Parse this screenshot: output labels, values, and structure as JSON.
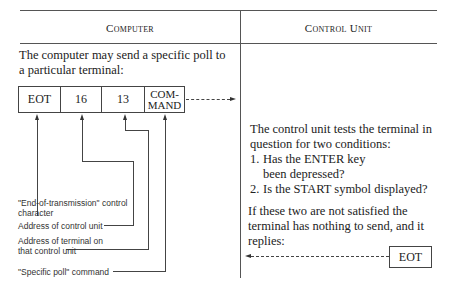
{
  "columns": {
    "computer": {
      "header": "Computer",
      "intro": "The computer may send a specific poll to a particular terminal:",
      "message_fields": [
        "EOT",
        "16",
        "13",
        "COM-\nMAND"
      ],
      "labels": [
        "\"End-of-transmission\" control character",
        "Address of control unit",
        "Address of terminal on that control unit",
        "\"Specific poll\" command"
      ]
    },
    "control_unit": {
      "header": "Control Unit",
      "intro": "The control unit tests the terminal in question for two conditions:",
      "conditions": [
        {
          "num": "1.",
          "text": "Has the ENTER key been depressed?"
        },
        {
          "num": "2.",
          "text": "Is the START symbol displayed?"
        }
      ],
      "outcome": "If these two are not satisfied the terminal has nothing to send, and it replies:",
      "reply_field": "EOT"
    }
  }
}
